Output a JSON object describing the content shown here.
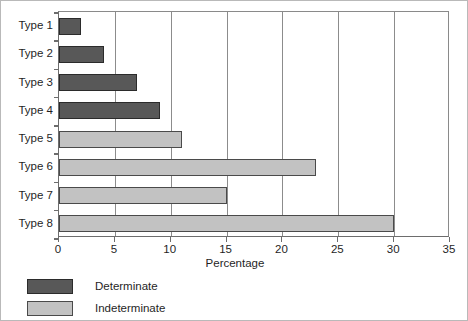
{
  "chart_data": {
    "type": "bar",
    "orientation": "horizontal",
    "title": "",
    "xlabel": "Percentage",
    "ylabel": "",
    "xlim": [
      0,
      35
    ],
    "xticks": [
      0,
      5,
      10,
      15,
      20,
      25,
      30,
      35
    ],
    "grid": true,
    "grid_axis": "x",
    "legend_position": "below-left",
    "categories": [
      "Type 1",
      "Type 2",
      "Type 3",
      "Type 4",
      "Type 5",
      "Type 6",
      "Type 7",
      "Type 8"
    ],
    "values": [
      2,
      4,
      7,
      9,
      11,
      23,
      15,
      30
    ],
    "groups": [
      "Determinate",
      "Determinate",
      "Determinate",
      "Determinate",
      "Indeterminate",
      "Indeterminate",
      "Indeterminate",
      "Indeterminate"
    ],
    "series": [
      {
        "name": "Determinate",
        "color": "#585858",
        "points": [
          {
            "category": "Type 1",
            "value": 2
          },
          {
            "category": "Type 2",
            "value": 4
          },
          {
            "category": "Type 3",
            "value": 7
          },
          {
            "category": "Type 4",
            "value": 9
          }
        ]
      },
      {
        "name": "Indeterminate",
        "color": "#c2c2c2",
        "points": [
          {
            "category": "Type 5",
            "value": 11
          },
          {
            "category": "Type 6",
            "value": 23
          },
          {
            "category": "Type 7",
            "value": 15
          },
          {
            "category": "Type 8",
            "value": 30
          }
        ]
      }
    ],
    "legend": [
      {
        "label": "Determinate",
        "color": "#585858"
      },
      {
        "label": "Indeterminate",
        "color": "#c2c2c2"
      }
    ]
  }
}
